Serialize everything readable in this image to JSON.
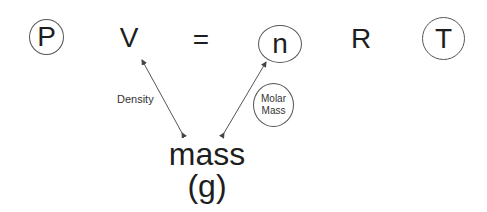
{
  "equation": {
    "terms": [
      {
        "symbol": "P",
        "circled": true
      },
      {
        "symbol": "V",
        "circled": false
      },
      {
        "symbol": "=",
        "circled": false
      },
      {
        "symbol": "n",
        "circled": true
      },
      {
        "symbol": "R",
        "circled": false
      },
      {
        "symbol": "T",
        "circled": true
      }
    ]
  },
  "center_node": {
    "line1": "mass",
    "line2": "(g)"
  },
  "relations": [
    {
      "from": "V",
      "to": "mass",
      "label": "Density",
      "label_circled": false
    },
    {
      "from": "n",
      "to": "mass",
      "label": "Molar Mass",
      "label_circled": true
    }
  ],
  "molar_mass_label": {
    "line1": "Molar",
    "line2": "Mass"
  }
}
